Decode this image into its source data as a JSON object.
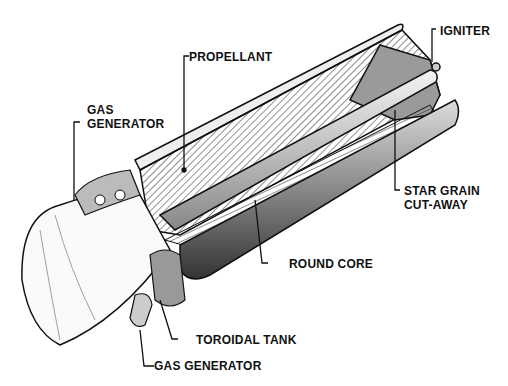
{
  "diagram": {
    "labels": {
      "propellant": "PROPELLANT",
      "igniter": "IGNITER",
      "gas_generator_top_1": "GAS",
      "gas_generator_top_2": "GENERATOR",
      "star_grain_1": "STAR GRAIN",
      "star_grain_2": "CUT-AWAY",
      "round_core": "ROUND CORE",
      "toroidal_tank": "TOROIDAL TANK",
      "gas_generator_bottom": "GAS GENERATOR"
    },
    "colors": {
      "ink": "#111111",
      "background": "#ffffff",
      "shade": "#9a9a9a"
    }
  }
}
